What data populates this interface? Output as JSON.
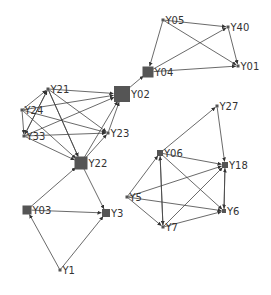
{
  "diagram": {
    "type": "directed-network",
    "node_color": "#555555",
    "edge_color": "#444444",
    "nodes": [
      {
        "id": "Y05",
        "label": "Y05",
        "x": 163,
        "y": 20,
        "size": 3
      },
      {
        "id": "Y40",
        "label": "Y40",
        "x": 228,
        "y": 27,
        "size": 3
      },
      {
        "id": "Y01",
        "label": "Y01",
        "x": 238,
        "y": 66,
        "size": 3
      },
      {
        "id": "Y04",
        "label": "Y04",
        "x": 148,
        "y": 72,
        "size": 11
      },
      {
        "id": "Y02",
        "label": "Y02",
        "x": 122,
        "y": 94,
        "size": 16
      },
      {
        "id": "Y21",
        "label": "Y21",
        "x": 48,
        "y": 89,
        "size": 3
      },
      {
        "id": "Y24",
        "label": "Y24",
        "x": 22,
        "y": 110,
        "size": 3
      },
      {
        "id": "Y33",
        "label": "Y33",
        "x": 24,
        "y": 136,
        "size": 3
      },
      {
        "id": "Y23",
        "label": "Y23",
        "x": 108,
        "y": 133,
        "size": 3
      },
      {
        "id": "Y22",
        "label": "Y22",
        "x": 81,
        "y": 163,
        "size": 13
      },
      {
        "id": "Y03",
        "label": "Y03",
        "x": 27,
        "y": 210,
        "size": 9
      },
      {
        "id": "Y3",
        "label": "Y3",
        "x": 106,
        "y": 213,
        "size": 8
      },
      {
        "id": "Y1",
        "label": "Y1",
        "x": 60,
        "y": 270,
        "size": 3
      },
      {
        "id": "Y27",
        "label": "Y27",
        "x": 217,
        "y": 106,
        "size": 3
      },
      {
        "id": "Y06",
        "label": "Y06",
        "x": 160,
        "y": 153,
        "size": 6
      },
      {
        "id": "Y18",
        "label": "Y18",
        "x": 225,
        "y": 165,
        "size": 6
      },
      {
        "id": "Y5",
        "label": "Y5",
        "x": 127,
        "y": 197,
        "size": 3
      },
      {
        "id": "Y6",
        "label": "Y6",
        "x": 224,
        "y": 211,
        "size": 4
      },
      {
        "id": "Y7",
        "label": "Y7",
        "x": 163,
        "y": 227,
        "size": 3
      }
    ],
    "edges": [
      [
        "Y05",
        "Y40"
      ],
      [
        "Y05",
        "Y01"
      ],
      [
        "Y05",
        "Y04"
      ],
      [
        "Y04",
        "Y40"
      ],
      [
        "Y04",
        "Y01"
      ],
      [
        "Y40",
        "Y01"
      ],
      [
        "Y02",
        "Y04"
      ],
      [
        "Y21",
        "Y02"
      ],
      [
        "Y21",
        "Y23"
      ],
      [
        "Y21",
        "Y22"
      ],
      [
        "Y21",
        "Y33"
      ],
      [
        "Y24",
        "Y21"
      ],
      [
        "Y24",
        "Y02"
      ],
      [
        "Y24",
        "Y23"
      ],
      [
        "Y24",
        "Y22"
      ],
      [
        "Y24",
        "Y33"
      ],
      [
        "Y33",
        "Y21"
      ],
      [
        "Y33",
        "Y02"
      ],
      [
        "Y33",
        "Y23"
      ],
      [
        "Y33",
        "Y22"
      ],
      [
        "Y23",
        "Y02"
      ],
      [
        "Y22",
        "Y02"
      ],
      [
        "Y22",
        "Y23"
      ],
      [
        "Y21",
        "Y22"
      ],
      [
        "Y03",
        "Y22"
      ],
      [
        "Y03",
        "Y3"
      ],
      [
        "Y22",
        "Y3"
      ],
      [
        "Y1",
        "Y03"
      ],
      [
        "Y1",
        "Y3"
      ],
      [
        "Y06",
        "Y27"
      ],
      [
        "Y27",
        "Y18"
      ],
      [
        "Y06",
        "Y18"
      ],
      [
        "Y06",
        "Y6"
      ],
      [
        "Y06",
        "Y7"
      ],
      [
        "Y5",
        "Y06"
      ],
      [
        "Y5",
        "Y18"
      ],
      [
        "Y5",
        "Y6"
      ],
      [
        "Y5",
        "Y7"
      ],
      [
        "Y7",
        "Y06"
      ],
      [
        "Y7",
        "Y18"
      ],
      [
        "Y7",
        "Y6"
      ],
      [
        "Y18",
        "Y6"
      ],
      [
        "Y6",
        "Y18"
      ]
    ]
  }
}
